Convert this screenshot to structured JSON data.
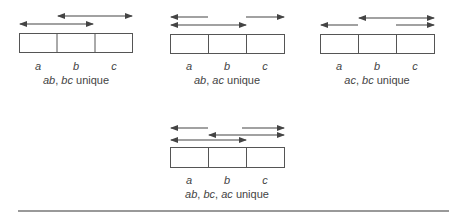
{
  "diagrams": [
    {
      "caption_parts": [
        {
          "text": "ab",
          "italic": true
        },
        {
          "text": ", ",
          "italic": false
        },
        {
          "text": "bc",
          "italic": true
        },
        {
          "text": " unique",
          "italic": false
        }
      ],
      "labels": [
        "a",
        "b",
        "c"
      ]
    },
    {
      "caption_parts": [
        {
          "text": "ab",
          "italic": true
        },
        {
          "text": ", ",
          "italic": false
        },
        {
          "text": "ac",
          "italic": true
        },
        {
          "text": " unique",
          "italic": false
        }
      ],
      "labels": [
        "a",
        "b",
        "c"
      ]
    },
    {
      "caption_parts": [
        {
          "text": "ac",
          "italic": true
        },
        {
          "text": ", ",
          "italic": false
        },
        {
          "text": "bc",
          "italic": true
        },
        {
          "text": " unique",
          "italic": false
        }
      ],
      "labels": [
        "a",
        "b",
        "c"
      ]
    },
    {
      "caption_parts": [
        {
          "text": "ab",
          "italic": true
        },
        {
          "text": ", ",
          "italic": false
        },
        {
          "text": "bc",
          "italic": true
        },
        {
          "text": ", ",
          "italic": false
        },
        {
          "text": "ac",
          "italic": true
        },
        {
          "text": " unique",
          "italic": false
        }
      ],
      "labels": [
        "a",
        "b",
        "c"
      ]
    }
  ],
  "colors": {
    "stroke": "#555555",
    "arrow": "#444444",
    "rule": "#777777"
  }
}
